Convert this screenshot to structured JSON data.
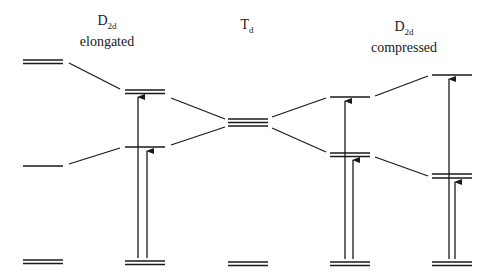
{
  "diagram": {
    "columns": [
      {
        "id": "elongated_free",
        "label_main": "",
        "label_sub": "",
        "label_line2": ""
      },
      {
        "id": "d2d_elongated",
        "label_main": "D",
        "label_sub": "2d",
        "label_line2": "elongated"
      },
      {
        "id": "td",
        "label_main": "T",
        "label_sub": "d",
        "label_line2": ""
      },
      {
        "id": "d2d_compressed",
        "label_main": "D",
        "label_sub": "2d",
        "label_line2": "compressed"
      },
      {
        "id": "compressed_far",
        "label_main": "",
        "label_sub": "",
        "label_line2": ""
      }
    ],
    "colors": {
      "line": "#1a1a1a",
      "background": "#ffffff"
    }
  }
}
